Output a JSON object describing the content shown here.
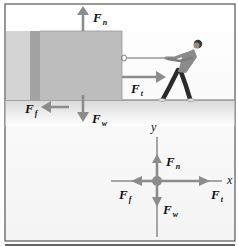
{
  "scene": {
    "title": "Free-body diagram: person pulling a block",
    "colors": {
      "arrow": "#8c8c8c",
      "block_front": "#bdbdbd",
      "block_side": "#a3a3a3",
      "block_back": "#d4d4d4",
      "floor_line": "#6e6e6e",
      "floor": "#e8e8e8",
      "frame": "#555555",
      "axis": "#555555",
      "person_shirt": "#8a8a8a",
      "person_pants": "#2b2b2b"
    },
    "forces": {
      "normal": {
        "symbol": "F",
        "sub": "n"
      },
      "tension": {
        "symbol": "F",
        "sub": "t"
      },
      "friction": {
        "symbol": "F",
        "sub": "f"
      },
      "weight": {
        "symbol": "F",
        "sub": "w"
      }
    }
  },
  "fbd": {
    "x_axis_label": "x",
    "y_axis_label": "y",
    "forces": {
      "normal": {
        "symbol": "F",
        "sub": "n"
      },
      "tension": {
        "symbol": "F",
        "sub": "t"
      },
      "friction": {
        "symbol": "F",
        "sub": "f"
      },
      "weight": {
        "symbol": "F",
        "sub": "w"
      }
    }
  }
}
